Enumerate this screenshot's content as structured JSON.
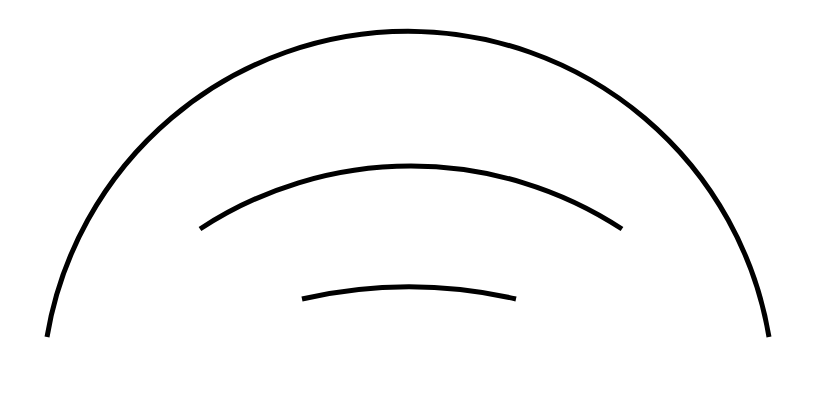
{
  "diagram": {
    "background": "#ffffff",
    "stroke_color": "#000000",
    "arcs": [
      {
        "name": "outer-arc",
        "start": [
          47,
          337
        ],
        "end": [
          769,
          337
        ],
        "radius": 366,
        "stroke_width": 5
      },
      {
        "name": "middle-arc",
        "start": [
          200,
          229
        ],
        "end": [
          622,
          229
        ],
        "radius": 385,
        "stroke_width": 5
      },
      {
        "name": "inner-arc",
        "start": [
          302,
          299
        ],
        "end": [
          516,
          299
        ],
        "radius": 483,
        "stroke_width": 5
      }
    ]
  }
}
